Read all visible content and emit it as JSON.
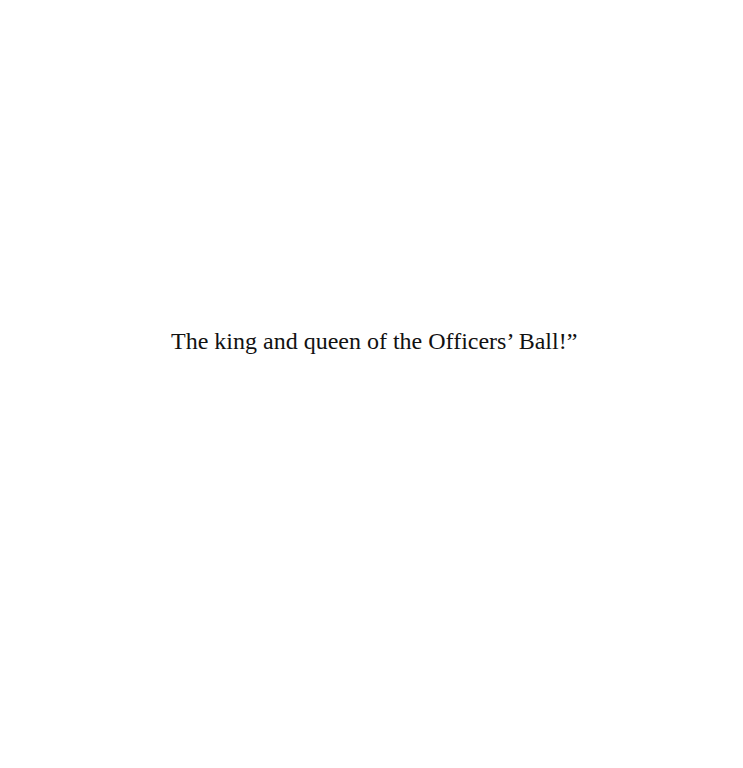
{
  "page": {
    "text_lines": [
      "The king and queen of the Officers’ Ball!”"
    ],
    "background_color": "#ffffff",
    "text_color": "#111111"
  }
}
